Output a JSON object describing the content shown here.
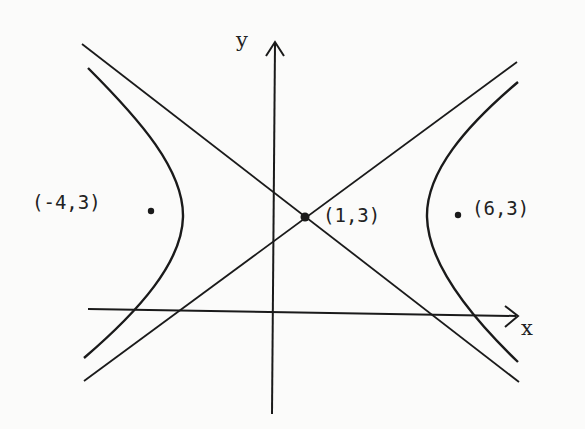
{
  "diagram": {
    "axes": {
      "x_label": "x",
      "y_label": "y"
    },
    "points": [
      {
        "name": "left-focus",
        "label": "(-4,3)",
        "x": -4,
        "y": 3
      },
      {
        "name": "center",
        "label": "(1,3)",
        "x": 1,
        "y": 3
      },
      {
        "name": "right-focus",
        "label": "(6,3)",
        "x": 6,
        "y": 3
      }
    ],
    "colors": {
      "ink": "#1a1a1a",
      "paper": "#fbfbfa"
    }
  }
}
